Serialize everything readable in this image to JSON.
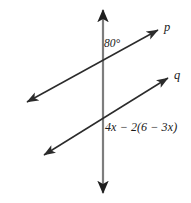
{
  "figure": {
    "width": 191,
    "height": 203,
    "background_color": "#ffffff",
    "labels": {
      "angle": "80°",
      "expression": "4x − 2(6 − 3x)",
      "line_p": "p",
      "line_q": "q"
    },
    "colors": {
      "transversal_line": "#2b2b2b",
      "vertical_line": "#7d7d7d",
      "text": "#1a1a1a"
    },
    "geometry": {
      "vertical_line": {
        "name": "vertical transversal",
        "x": 103,
        "y_top": 10,
        "y_bottom": 193,
        "arrows": "both",
        "stroke_width": 2.2
      },
      "line_p": {
        "name": "line p",
        "x1": 27,
        "y1": 102,
        "x2": 158,
        "y2": 30,
        "arrows": "both",
        "stroke_width": 1.5
      },
      "line_q": {
        "name": "line q",
        "x1": 44,
        "y1": 155,
        "x2": 168,
        "y2": 78,
        "arrows": "both",
        "stroke_width": 1.5
      },
      "intersection_p": {
        "x": 103,
        "y": 57
      },
      "intersection_q": {
        "x": 103,
        "y": 124
      }
    }
  }
}
